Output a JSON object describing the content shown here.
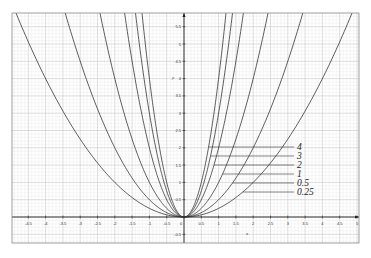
{
  "chart_data": {
    "type": "line",
    "title": "",
    "xlabel": "x",
    "ylabel": "y",
    "xlim": [
      -4.95,
      5.05
    ],
    "ylim": [
      -0.75,
      5.9
    ],
    "grid": true,
    "grid_major_step": 0.5,
    "grid_minor_step": 0.1,
    "x_ticks": [
      "-4.5",
      "-4",
      "-3.5",
      "-3",
      "-2.5",
      "-2",
      "-1.5",
      "-1",
      "-0.5",
      "0",
      "0.5",
      "1",
      "1.5",
      "2",
      "2.5",
      "3",
      "3.5",
      "4",
      "4.5",
      "5"
    ],
    "y_ticks": [
      "-0.5",
      "0.5",
      "1",
      "1.5",
      "2",
      "2.5",
      "3",
      "3.5",
      "4",
      "4.5",
      "5",
      "5.5"
    ],
    "function": "y = a·x²",
    "series": [
      {
        "name": "4",
        "a": 4
      },
      {
        "name": "3",
        "a": 3
      },
      {
        "name": "2",
        "a": 2
      },
      {
        "name": "1",
        "a": 1
      },
      {
        "name": "0.5",
        "a": 0.5
      },
      {
        "name": "0.25",
        "a": 0.25
      }
    ],
    "legend": {
      "position": "inline-right-of-curves",
      "style": "leader-lines"
    }
  },
  "labels": {
    "x_axis": "x",
    "y_axis": "y",
    "curves": [
      "4",
      "3",
      "2",
      "1",
      "0.5",
      "0.25"
    ]
  },
  "colors": {
    "curve": "#333333",
    "axis": "#222222",
    "grid_major": "#bdbdbd",
    "grid_minor": "#e4e4e4",
    "frame": "#888888"
  }
}
